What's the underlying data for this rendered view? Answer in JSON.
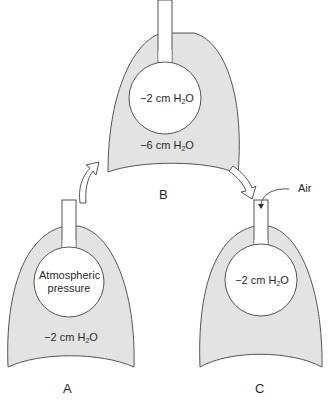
{
  "colors": {
    "lung_fill": "#e3e3e3",
    "stroke": "#555555",
    "background": "#ffffff"
  },
  "panels": [
    {
      "id": "A",
      "letter": "A",
      "alveolus_label_1": "Atmospheric",
      "alveolus_label_2": "pressure",
      "pleural_value": "−2 cm H",
      "pleural_sub": "2",
      "pleural_tail": "O"
    },
    {
      "id": "B",
      "letter": "B",
      "alveolus_value": "−2 cm H",
      "alveolus_sub": "2",
      "alveolus_tail": "O",
      "pleural_value": "−6 cm H",
      "pleural_sub": "2",
      "pleural_tail": "O"
    },
    {
      "id": "C",
      "letter": "C",
      "alveolus_value": "−2 cm H",
      "alveolus_sub": "2",
      "alveolus_tail": "O",
      "air_label": "Air"
    }
  ],
  "arrows": [
    {
      "from": "A",
      "to": "B",
      "shape": "curved-outline-arrow"
    },
    {
      "from": "B",
      "to": "C",
      "shape": "curved-outline-arrow"
    }
  ]
}
